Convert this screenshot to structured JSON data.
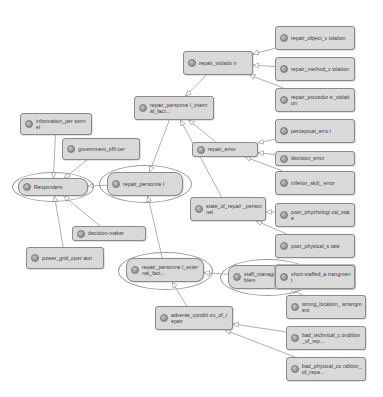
{
  "diagram": {
    "type": "node-link-diagram",
    "background_color": "#ffffff",
    "node_fill_color": "#d9d9d9",
    "node_border_color": "#8a8a8a",
    "edge_color": "#9a9a9a",
    "icon_name": "class-node-icon"
  },
  "nodes": [
    {
      "id": "information_personnel",
      "label": "information_per\nsonnel",
      "shape": "rect",
      "x": 20,
      "y": 113,
      "w": 72,
      "h": 22
    },
    {
      "id": "government_officer",
      "label": "government_offi\ncer",
      "shape": "rect",
      "x": 62,
      "y": 138,
      "w": 78,
      "h": 22
    },
    {
      "id": "responders",
      "label": "Responders",
      "shape": "rect-ring",
      "x": 18,
      "y": 178,
      "w": 70,
      "h": 18,
      "ring_x": 12,
      "ring_y": 172,
      "ring_w": 82,
      "ring_h": 30
    },
    {
      "id": "decision_maker",
      "label": "decision-maker",
      "shape": "rect",
      "x": 72,
      "y": 226,
      "w": 74,
      "h": 15
    },
    {
      "id": "power_grid_operator",
      "label": "power_grid_oper\nator",
      "shape": "rect",
      "x": 26,
      "y": 247,
      "w": 78,
      "h": 22
    },
    {
      "id": "repair_personnel",
      "label": "repair_personne\nl",
      "shape": "rect-ring",
      "x": 107,
      "y": 172,
      "w": 76,
      "h": 24,
      "ring_x": 99,
      "ring_y": 165,
      "ring_w": 93,
      "ring_h": 38
    },
    {
      "id": "repair_personnel_internal_factor",
      "label": "repair_personne\nl_internal_fact...",
      "shape": "rect",
      "x": 134,
      "y": 96,
      "w": 80,
      "h": 24
    },
    {
      "id": "repair_violation",
      "label": "repair_violatio\nn",
      "shape": "rect",
      "x": 183,
      "y": 51,
      "w": 70,
      "h": 24
    },
    {
      "id": "repair_error",
      "label": "repair_error",
      "shape": "rect",
      "x": 192,
      "y": 142,
      "w": 66,
      "h": 15
    },
    {
      "id": "state_of_repair_personnel",
      "label": "state_of_repair\n_personnel",
      "shape": "rect",
      "x": 190,
      "y": 197,
      "w": 76,
      "h": 24
    },
    {
      "id": "repair_personnel_external_factor",
      "label": "repair_personne\nl_external_fact...",
      "shape": "rect-ring",
      "x": 126,
      "y": 258,
      "w": 78,
      "h": 24,
      "ring_x": 118,
      "ring_y": 252,
      "ring_w": 95,
      "ring_h": 38
    },
    {
      "id": "staff_management_problem",
      "label": "staff_managemen\nt_problem",
      "shape": "rect-ring",
      "x": 228,
      "y": 265,
      "w": 78,
      "h": 24,
      "ring_x": 220,
      "ring_y": 259,
      "ring_w": 95,
      "ring_h": 37
    },
    {
      "id": "adverse_condition_of_repair",
      "label": "adverse_conditi\non_of_repair",
      "shape": "rect",
      "x": 155,
      "y": 306,
      "w": 78,
      "h": 24
    },
    {
      "id": "repair_object_violation",
      "label": "repair_object_v\niolation",
      "shape": "rect",
      "x": 275,
      "y": 26,
      "w": 80,
      "h": 24
    },
    {
      "id": "repair_method_violation",
      "label": "repair_method_v\niolation",
      "shape": "rect",
      "x": 275,
      "y": 57,
      "w": 80,
      "h": 24
    },
    {
      "id": "repair_procedure_violation",
      "label": "repair_procedur\ne_violation",
      "shape": "rect",
      "x": 275,
      "y": 88,
      "w": 80,
      "h": 24
    },
    {
      "id": "perceptual_error",
      "label": "perceptual_erro\nr",
      "shape": "rect",
      "x": 275,
      "y": 119,
      "w": 80,
      "h": 24
    },
    {
      "id": "decision_error",
      "label": "decision_error",
      "shape": "rect",
      "x": 275,
      "y": 151,
      "w": 80,
      "h": 15
    },
    {
      "id": "inferior_skill_error",
      "label": "inferior_skill_\nerror",
      "shape": "rect",
      "x": 275,
      "y": 171,
      "w": 80,
      "h": 24
    },
    {
      "id": "poor_phychological_state",
      "label": "poor_phychologi\ncal_state",
      "shape": "rect",
      "x": 275,
      "y": 203,
      "w": 80,
      "h": 24
    },
    {
      "id": "poor_physical_state",
      "label": "poor_physical_s\ntate",
      "shape": "rect",
      "x": 275,
      "y": 234,
      "w": 80,
      "h": 24
    },
    {
      "id": "short_staffed_arrangment",
      "label": "short-staffed_a\nrrangment",
      "shape": "rect-double",
      "x": 275,
      "y": 265,
      "w": 80,
      "h": 24
    },
    {
      "id": "wrong_location_arrangment",
      "label": "wrong_location_\narrangment",
      "shape": "rect",
      "x": 286,
      "y": 295,
      "w": 80,
      "h": 24
    },
    {
      "id": "bad_technical_condition_of_rep",
      "label": "bad_technical_c\nondition_of_rep...",
      "shape": "rect",
      "x": 286,
      "y": 326,
      "w": 80,
      "h": 24
    },
    {
      "id": "bad_physical_condition_of_repa",
      "label": "bad_physical_co\nndition_of_repa...",
      "shape": "rect",
      "x": 286,
      "y": 357,
      "w": 80,
      "h": 24
    }
  ],
  "edges": [
    {
      "from": "information_personnel",
      "to": "responders",
      "arrow": "hollow-triangle"
    },
    {
      "from": "government_officer",
      "to": "responders",
      "arrow": "hollow-triangle"
    },
    {
      "from": "decision_maker",
      "to": "responders",
      "arrow": "hollow-triangle"
    },
    {
      "from": "power_grid_operator",
      "to": "responders",
      "arrow": "hollow-triangle"
    },
    {
      "from": "repair_personnel",
      "to": "responders",
      "arrow": "hollow-triangle"
    },
    {
      "from": "repair_personnel_internal_factor",
      "to": "repair_personnel",
      "arrow": "hollow-triangle"
    },
    {
      "from": "repair_personnel_external_factor",
      "to": "repair_personnel",
      "arrow": "hollow-triangle"
    },
    {
      "from": "repair_violation",
      "to": "repair_personnel_internal_factor",
      "arrow": "hollow-triangle"
    },
    {
      "from": "repair_error",
      "to": "repair_personnel_internal_factor",
      "arrow": "hollow-triangle"
    },
    {
      "from": "state_of_repair_personnel",
      "to": "repair_personnel_internal_factor",
      "arrow": "hollow-triangle"
    },
    {
      "from": "repair_object_violation",
      "to": "repair_violation",
      "arrow": "hollow-triangle"
    },
    {
      "from": "repair_method_violation",
      "to": "repair_violation",
      "arrow": "hollow-triangle"
    },
    {
      "from": "repair_procedure_violation",
      "to": "repair_violation",
      "arrow": "hollow-triangle"
    },
    {
      "from": "perceptual_error",
      "to": "repair_error",
      "arrow": "hollow-triangle"
    },
    {
      "from": "decision_error",
      "to": "repair_error",
      "arrow": "hollow-triangle"
    },
    {
      "from": "inferior_skill_error",
      "to": "repair_error",
      "arrow": "hollow-triangle"
    },
    {
      "from": "poor_phychological_state",
      "to": "state_of_repair_personnel",
      "arrow": "hollow-triangle"
    },
    {
      "from": "poor_physical_state",
      "to": "state_of_repair_personnel",
      "arrow": "hollow-triangle"
    },
    {
      "from": "staff_management_problem",
      "to": "repair_personnel_external_factor",
      "arrow": "hollow-triangle"
    },
    {
      "from": "adverse_condition_of_repair",
      "to": "repair_personnel_external_factor",
      "arrow": "hollow-triangle"
    },
    {
      "from": "short_staffed_arrangment",
      "to": "staff_management_problem",
      "arrow": "hollow-triangle"
    },
    {
      "from": "wrong_location_arrangment",
      "to": "staff_management_problem",
      "arrow": "hollow-triangle"
    },
    {
      "from": "bad_technical_condition_of_rep",
      "to": "adverse_condition_of_repair",
      "arrow": "hollow-triangle"
    },
    {
      "from": "bad_physical_condition_of_repa",
      "to": "adverse_condition_of_repair",
      "arrow": "hollow-triangle"
    }
  ]
}
